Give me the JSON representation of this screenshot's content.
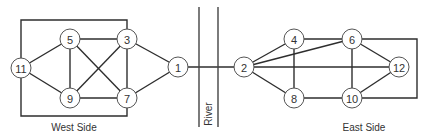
{
  "diagram": {
    "type": "graph",
    "regions": {
      "west": {
        "label": "West Side"
      },
      "east": {
        "label": "East Side"
      },
      "river": {
        "label": "River"
      }
    },
    "nodes": [
      {
        "id": "11",
        "label": "11",
        "x": 21,
        "y": 68,
        "side": "west"
      },
      {
        "id": "5",
        "label": "5",
        "x": 70,
        "y": 39,
        "side": "west"
      },
      {
        "id": "3",
        "label": "3",
        "x": 127,
        "y": 39,
        "side": "west"
      },
      {
        "id": "9",
        "label": "9",
        "x": 70,
        "y": 98,
        "side": "west"
      },
      {
        "id": "7",
        "label": "7",
        "x": 127,
        "y": 98,
        "side": "west"
      },
      {
        "id": "1",
        "label": "1",
        "x": 178,
        "y": 67,
        "side": "west"
      },
      {
        "id": "2",
        "label": "2",
        "x": 244,
        "y": 67,
        "side": "east"
      },
      {
        "id": "4",
        "label": "4",
        "x": 294,
        "y": 39,
        "side": "east"
      },
      {
        "id": "6",
        "label": "6",
        "x": 352,
        "y": 39,
        "side": "east"
      },
      {
        "id": "8",
        "label": "8",
        "x": 294,
        "y": 98,
        "side": "east"
      },
      {
        "id": "10",
        "label": "10",
        "x": 352,
        "y": 98,
        "side": "east"
      },
      {
        "id": "12",
        "label": "12",
        "x": 399,
        "y": 67,
        "side": "east"
      }
    ],
    "edges": [
      [
        "11",
        "5"
      ],
      [
        "11",
        "9"
      ],
      [
        "11",
        "3",
        "box-top"
      ],
      [
        "11",
        "7",
        "box-bottom"
      ],
      [
        "5",
        "3"
      ],
      [
        "5",
        "9"
      ],
      [
        "5",
        "7"
      ],
      [
        "9",
        "3"
      ],
      [
        "9",
        "7"
      ],
      [
        "3",
        "7"
      ],
      [
        "3",
        "1"
      ],
      [
        "7",
        "1"
      ],
      [
        "1",
        "2",
        "bridge"
      ],
      [
        "2",
        "4"
      ],
      [
        "2",
        "6"
      ],
      [
        "2",
        "12"
      ],
      [
        "2",
        "8"
      ],
      [
        "4",
        "6"
      ],
      [
        "4",
        "8"
      ],
      [
        "6",
        "10"
      ],
      [
        "6",
        "12"
      ],
      [
        "6",
        "10",
        "box-right"
      ],
      [
        "8",
        "10"
      ],
      [
        "10",
        "12"
      ]
    ]
  }
}
